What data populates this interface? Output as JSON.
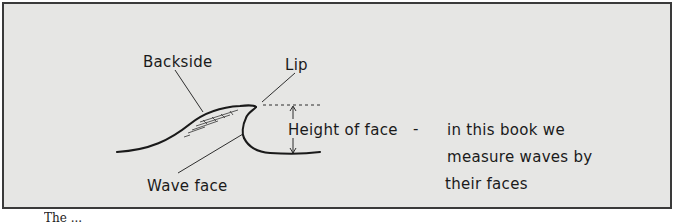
{
  "diagram": {
    "labels": {
      "backside": "Backside",
      "lip": "Lip",
      "height_of_face": "Height of face",
      "dash": "-",
      "wave_face": "Wave face"
    },
    "note": {
      "line1": "in this book we",
      "line2": "measure waves by",
      "line3": "their faces"
    },
    "caption_partial": "The ..."
  },
  "colors": {
    "frame_border": "#3a3a3a",
    "panel_background": "#e6e6e4",
    "ink": "#1a1a1a",
    "page_background": "#ffffff"
  }
}
